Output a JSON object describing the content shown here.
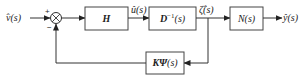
{
  "diagram": {
    "type": "block-diagram-feedback-loop",
    "input": {
      "label": "v̂(s)"
    },
    "summing_junction": {
      "plus_sign": "+",
      "minus_sign": "−"
    },
    "blocks": [
      {
        "id": "H",
        "label": "H"
      },
      {
        "id": "Dinv",
        "label_main": "D",
        "label_sup": "−1",
        "label_arg": "(s)"
      },
      {
        "id": "N",
        "label_main": "N",
        "label_arg": "(s)"
      },
      {
        "id": "KPsi",
        "label_main": "KΨ",
        "label_arg": "(s)"
      }
    ],
    "signals": {
      "u": "û(s)",
      "zeta": "ζ̂(s)",
      "y": "ŷ(s)"
    },
    "colors": {
      "line": "#333333",
      "box_stroke": "#444444",
      "background": "#ffffff"
    }
  }
}
